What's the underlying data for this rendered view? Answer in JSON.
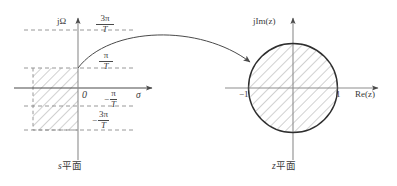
{
  "figure": {
    "title_s_plane": {
      "var": "s",
      "cjk": "平面"
    },
    "title_z_plane": {
      "var": "z",
      "cjk": "平面"
    },
    "s_plane": {
      "vertical_axis_label": "jΩ",
      "horizontal_axis_label": "σ",
      "origin_label": "0",
      "tick_labels": [
        {
          "id": "pos-3pi-T",
          "sign": "",
          "numerator": "3π",
          "denominator": "T",
          "value": "3π/T"
        },
        {
          "id": "pos-pi-T",
          "sign": "",
          "numerator": "π",
          "denominator": "T",
          "value": "π/T"
        },
        {
          "id": "neg-pi-T",
          "sign": "−",
          "numerator": "π",
          "denominator": "T",
          "value": "-π/T"
        },
        {
          "id": "neg-3pi-T",
          "sign": "−",
          "numerator": "3π",
          "denominator": "T",
          "value": "-3π/T"
        }
      ],
      "region_description": "hatched primary strip, left half-plane between -π/T and π/T"
    },
    "z_plane": {
      "vertical_axis_label": "jIm(z)",
      "horizontal_axis_label": "Re(z)",
      "tick_labels": [
        {
          "id": "minus-one",
          "value": "−1"
        },
        {
          "id": "plus-one",
          "value": "1"
        }
      ],
      "unit_circle_radius_label": "1",
      "region_description": "hatched interior of the unit circle"
    },
    "mapping_arrow": {
      "description": "curved arrow mapping s-plane strip onto the z-plane unit disk",
      "from": "s平面",
      "to": "z平面"
    },
    "colors": {
      "line": "#4a4a4a",
      "hatch": "#8d8d8d",
      "dashed": "#8d8d8d",
      "circle": "#2e2e2e",
      "text": "#3a3a3a",
      "background": "#ffffff"
    }
  }
}
